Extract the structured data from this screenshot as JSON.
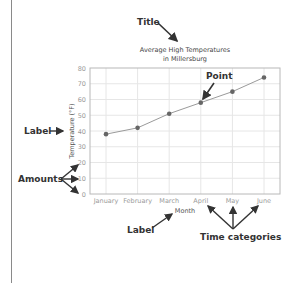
{
  "chart_data": {
    "type": "line",
    "title": "Average High Temperatures in Millersburg",
    "title_lines": [
      "Average High Temperatures",
      "in Millersburg"
    ],
    "xlabel": "Month",
    "ylabel": "Temperature (°F)",
    "categories": [
      "January",
      "February",
      "March",
      "April",
      "May",
      "June"
    ],
    "series": [
      {
        "name": "Average High Temperature",
        "values": [
          38,
          42,
          51,
          58,
          65,
          74
        ]
      }
    ],
    "ylim": [
      0,
      80
    ],
    "yticks": [
      0,
      10,
      20,
      30,
      40,
      50,
      60,
      70,
      80
    ],
    "grid": true,
    "legend": "none",
    "colors": {
      "line": "#9a9a9a",
      "point": "#666666",
      "grid": "#e6e6e6",
      "frame": "#b8b8b8"
    },
    "annotations": [
      {
        "text": "Title",
        "target": "chart title"
      },
      {
        "text": "Point",
        "target": "April data point"
      },
      {
        "text": "Label",
        "target": "y-axis label"
      },
      {
        "text": "Amounts",
        "target": "y-axis tick values"
      },
      {
        "text": "Label",
        "target": "x-axis label"
      },
      {
        "text": "Time categories",
        "target": "x-axis categories"
      }
    ]
  },
  "annotations": {
    "title": "Title",
    "point": "Point",
    "ylabel": "Label",
    "amounts": "Amounts",
    "xlabel": "Label",
    "time_categories": "Time categories"
  }
}
